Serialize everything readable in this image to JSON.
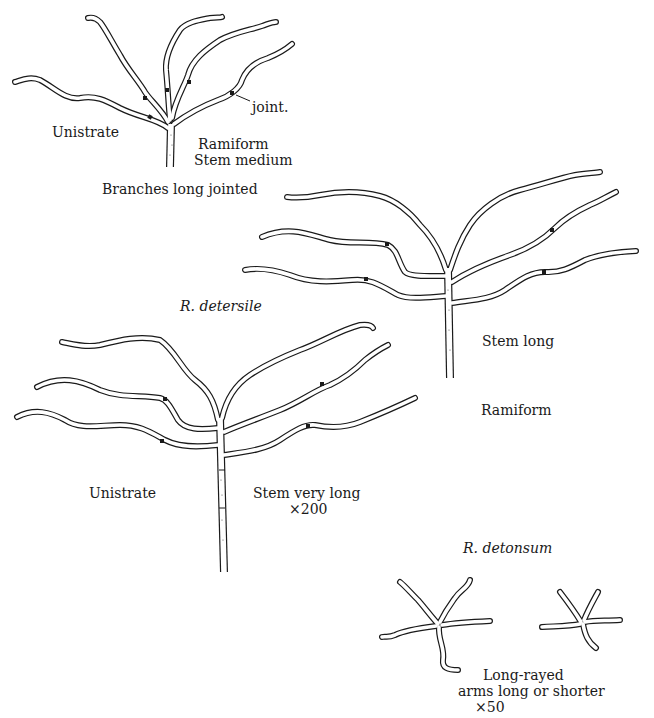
{
  "figure": {
    "background": "#ffffff",
    "ink": "#1a1a1a",
    "top_left": {
      "species": null,
      "labels": {
        "joint": "joint.",
        "left": "Unistrate",
        "right_1": "Ramiform",
        "right_2": "Stem medium",
        "caption": "Branches long jointed"
      }
    },
    "right_middle": {
      "labels": {
        "stem": "Stem long",
        "type": "Ramiform"
      }
    },
    "left_middle": {
      "species": "R. detersile",
      "labels": {
        "left": "Unistrate",
        "stem": "Stem very long",
        "magnification": "×200"
      }
    },
    "bottom_right": {
      "species": "R. detonsum",
      "labels": {
        "line_1": "Long-rayed",
        "line_2": "arms long or shorter",
        "magnification": "×50"
      }
    }
  }
}
